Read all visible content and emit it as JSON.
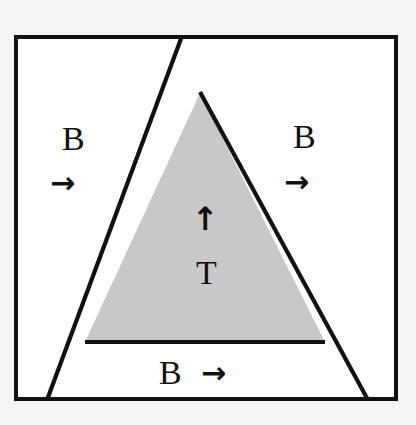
{
  "figure": {
    "type": "geometric-diagram",
    "background_color": "#f4f4f4",
    "frame": {
      "x": 14,
      "y": 35,
      "width": 384,
      "height": 366,
      "stroke": "#111111",
      "stroke_width": 4,
      "fill": "#ffffff"
    },
    "shaded_triangle": {
      "name": "block-T",
      "fill": "#c8c8c8",
      "stroke": "#111111",
      "stroke_width": 4,
      "apex": {
        "x": 200,
        "y": 93
      },
      "bottom_left": {
        "x": 85,
        "y": 342
      },
      "bottom_right": {
        "x": 325,
        "y": 342
      }
    },
    "lines": [
      {
        "name": "left-fault-line",
        "x1": 182,
        "y1": 36,
        "x2": 47,
        "y2": 400,
        "stroke": "#111111",
        "stroke_width": 4
      },
      {
        "name": "right-fault-line",
        "x1": 200,
        "y1": 93,
        "x2": 368,
        "y2": 400,
        "stroke": "#111111",
        "stroke_width": 4
      },
      {
        "name": "block-base-line",
        "x1": 85,
        "y1": 342,
        "x2": 325,
        "y2": 342,
        "stroke": "#111111",
        "stroke_width": 4
      }
    ],
    "labels": {
      "b_left": "B",
      "b_right": "B",
      "b_bottom": "B",
      "t_center": "T"
    },
    "arrows": {
      "b_left": "→",
      "b_right": "→",
      "b_bottom": "→",
      "t_center": "↑"
    },
    "arrow_names": {
      "b_left": "right-arrow-icon",
      "b_right": "right-arrow-icon",
      "b_bottom": "right-arrow-icon",
      "t_center": "up-arrow-icon"
    }
  }
}
